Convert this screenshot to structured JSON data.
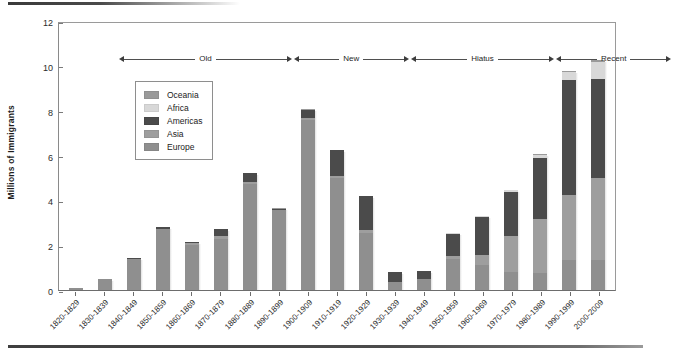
{
  "chart_data": {
    "type": "bar",
    "subtype": "stacked-bar",
    "title": "",
    "xlabel": "",
    "ylabel": "Millions of Immigrants",
    "ylim": [
      0,
      12
    ],
    "yticks": [
      0,
      2,
      4,
      6,
      8,
      10,
      12
    ],
    "grid": false,
    "legend_position": "upper-left",
    "categories": [
      "1820-1829",
      "1830-1839",
      "1840-1849",
      "1850-1859",
      "1860-1869",
      "1870-1879",
      "1880-1889",
      "1890-1899",
      "1900-1909",
      "1910-1919",
      "1920-1929",
      "1930-1939",
      "1940-1949",
      "1950-1959",
      "1960-1969",
      "1970-1979",
      "1980-1989",
      "1990-1999",
      "2000-2009"
    ],
    "series": [
      {
        "name": "Europe",
        "color": "#8f8f8f",
        "values": [
          0.1,
          0.48,
          1.4,
          2.7,
          2.03,
          2.27,
          4.74,
          3.56,
          7.57,
          4.98,
          2.56,
          0.35,
          0.47,
          1.37,
          1.12,
          0.8,
          0.76,
          1.35,
          1.35
        ]
      },
      {
        "name": "Asia",
        "color": "#9e9e9e",
        "values": [
          0.0,
          0.0,
          0.0,
          0.04,
          0.06,
          0.12,
          0.06,
          0.03,
          0.11,
          0.11,
          0.11,
          0.02,
          0.03,
          0.15,
          0.43,
          1.59,
          2.42,
          2.89,
          3.63
        ]
      },
      {
        "name": "Americas",
        "color": "#4b4b4b",
        "values": [
          0.01,
          0.02,
          0.03,
          0.05,
          0.06,
          0.34,
          0.43,
          0.04,
          0.36,
          1.14,
          1.52,
          0.42,
          0.35,
          1.0,
          1.72,
          1.98,
          2.69,
          5.14,
          4.44
        ]
      },
      {
        "name": "Africa",
        "color": "#d8d8d8",
        "values": [
          0.0,
          0.0,
          0.0,
          0.0,
          0.0,
          0.0,
          0.0,
          0.0,
          0.01,
          0.01,
          0.01,
          0.0,
          0.0,
          0.01,
          0.03,
          0.08,
          0.14,
          0.35,
          0.76
        ]
      },
      {
        "name": "Oceania",
        "color": "#9a9a9a",
        "values": [
          0.0,
          0.0,
          0.0,
          0.0,
          0.0,
          0.01,
          0.01,
          0.01,
          0.01,
          0.01,
          0.01,
          0.0,
          0.0,
          0.01,
          0.02,
          0.02,
          0.04,
          0.06,
          0.07
        ]
      }
    ],
    "totals": [
      0.11,
      0.5,
      1.43,
      2.79,
      2.15,
      2.74,
      5.24,
      3.64,
      8.06,
      6.25,
      4.21,
      0.79,
      0.85,
      2.54,
      3.32,
      4.47,
      6.05,
      9.78,
      10.25
    ],
    "annotations": [
      {
        "label": "Old",
        "start_category": "1820-1829",
        "end_category": "1870-1879"
      },
      {
        "label": "New",
        "start_category": "1880-1889",
        "end_category": "1910-1919"
      },
      {
        "label": "Hiatus",
        "start_category": "1920-1929",
        "end_category": "1960-1969"
      },
      {
        "label": "Recent",
        "start_category": "1970-1979",
        "end_category": "2000-2009"
      }
    ]
  },
  "legend": {
    "items": [
      {
        "label": "Oceania",
        "color": "#9a9a9a"
      },
      {
        "label": "Africa",
        "color": "#d8d8d8"
      },
      {
        "label": "Americas",
        "color": "#4b4b4b"
      },
      {
        "label": "Asia",
        "color": "#9e9e9e"
      },
      {
        "label": "Europe",
        "color": "#8f8f8f"
      }
    ]
  },
  "axis": {
    "y_label": "Millions of Immigrants",
    "y_ticks": [
      "0",
      "2",
      "4",
      "6",
      "8",
      "10",
      "12"
    ],
    "x_labels": [
      "1820-1829",
      "1830-1839",
      "1840-1849",
      "1850-1859",
      "1860-1869",
      "1870-1879",
      "1880-1889",
      "1890-1899",
      "1900-1909",
      "1910-1919",
      "1920-1929",
      "1930-1939",
      "1940-1949",
      "1950-1959",
      "1960-1969",
      "1970-1979",
      "1980-1989",
      "1990-1999",
      "2000-2009"
    ]
  },
  "eras": [
    "Old",
    "New",
    "Hiatus",
    "Recent"
  ],
  "colors": {
    "europe": "#8f8f8f",
    "asia": "#9e9e9e",
    "americas": "#4b4b4b",
    "africa": "#d8d8d8",
    "oceania": "#9a9a9a",
    "axis": "#6d6d6d",
    "background": "#ffffff"
  }
}
